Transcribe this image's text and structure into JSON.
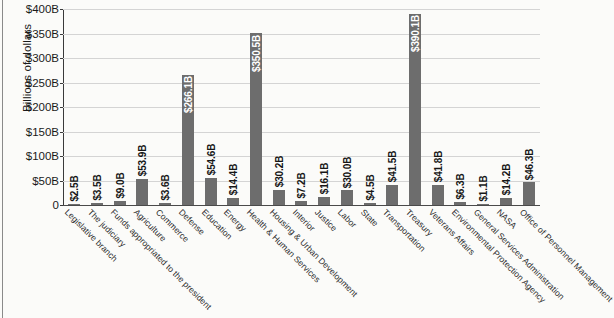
{
  "chart_data": {
    "type": "bar",
    "title": "",
    "xlabel": "",
    "ylabel": "Billions of dollars",
    "ylim": [
      0,
      400
    ],
    "ytick_labels": [
      "$400B",
      "$350B",
      "$300B",
      "$250B",
      "$200B",
      "$150B",
      "$100B",
      "$50B",
      "0"
    ],
    "ytick_values": [
      400,
      350,
      300,
      250,
      200,
      150,
      100,
      50,
      0
    ],
    "grid": "horizontal",
    "legend": "none",
    "bar_color": "#6d6d6d",
    "categories": [
      "Legislative branch",
      "The judiciary",
      "Funds appropriated to the president",
      "Agriculture",
      "Commerce",
      "Defense",
      "Education",
      "Energy",
      "Health & Human Services",
      "Housing & Urban Development",
      "Interior",
      "Justice",
      "Labor",
      "State",
      "Transportation",
      "Treasury",
      "Veterans Affairs",
      "Environmental Protection Agency",
      "General Services Administration",
      "NASA",
      "Office of Personnel Management"
    ],
    "values": [
      2.5,
      3.5,
      9.0,
      53.9,
      3.6,
      266.1,
      54.6,
      14.4,
      350.5,
      30.2,
      7.2,
      16.1,
      30.0,
      4.5,
      41.5,
      390.1,
      41.8,
      6.3,
      1.1,
      14.2,
      46.3
    ],
    "data_labels": [
      "$2.5B",
      "$3.5B",
      "$9.0B",
      "$53.9B",
      "$3.6B",
      "$266.1B",
      "$54.6B",
      "$14.4B",
      "$350.5B",
      "$30.2B",
      "$7.2B",
      "$16.1B",
      "$30.0B",
      "$4.5B",
      "$41.5B",
      "$390.1B",
      "$41.8B",
      "$6.3B",
      "$1.1B",
      "$14.2B",
      "$46.3B"
    ]
  }
}
